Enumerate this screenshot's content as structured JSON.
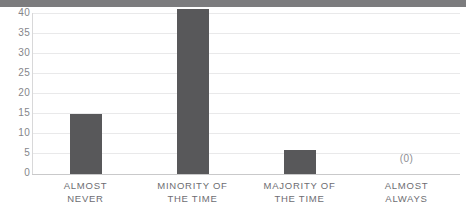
{
  "chart_data": {
    "type": "bar",
    "title": "",
    "subtitle": "",
    "xlabel": "",
    "ylabel": "",
    "categories": [
      "ALMOST NEVER",
      "MINORITY OF THE TIME",
      "MAJORITY OF THE TIME",
      "ALMOST ALWAYS"
    ],
    "category_lines": [
      [
        "ALMOST",
        "NEVER"
      ],
      [
        "MINORITY OF",
        "THE TIME"
      ],
      [
        "MAJORITY OF",
        "THE TIME"
      ],
      [
        "ALMOST",
        "ALWAYS"
      ]
    ],
    "values": [
      15,
      41,
      6,
      0
    ],
    "data_labels": [
      "",
      "",
      "",
      "(0)"
    ],
    "ylim": [
      0,
      41
    ],
    "yticks": [
      0,
      5,
      10,
      15,
      20,
      25,
      30,
      35,
      40
    ],
    "ytick_labels": [
      "0",
      "5",
      "10",
      "15",
      "20",
      "25",
      "30",
      "35",
      "40"
    ],
    "grid": true,
    "grid_axis": "y",
    "legend": false,
    "legend_position": "none",
    "colors": {
      "bar": "#58585a",
      "gridline": "#e9e9ea",
      "axis": "#c9c9ca",
      "tick_text": "#85858a",
      "category_text": "#6d6d72",
      "data_label_text": "#8d8d92",
      "background": "#ffffff",
      "top_band": "#7c7c7e"
    }
  }
}
